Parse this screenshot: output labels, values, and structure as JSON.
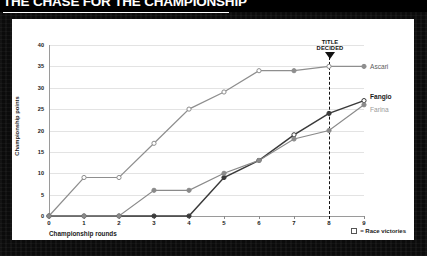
{
  "headline": "THE CHASE FOR THE CHAMPIONSHIP",
  "annotation": {
    "title_decided_line1": "TITLE",
    "title_decided_line2": "DECIDED",
    "at_round": 8
  },
  "legend": {
    "marker_icon": "open-square-icon",
    "text": "= Race victories"
  },
  "series_labels": {
    "ascari": "Ascari",
    "fangio": "Fangio",
    "farina": "Farina"
  },
  "colors": {
    "ascari": "#8e8e8e",
    "fangio": "#3a3a3a",
    "farina": "#8a8a8a",
    "grid": "#e3e3e3",
    "axis": "#9a9a9a",
    "frame": "#0b0b0b",
    "card": "#ffffff"
  },
  "chart_data": {
    "type": "line",
    "title": "THE CHASE FOR THE CHAMPIONSHIP",
    "xlabel": "Championship rounds",
    "ylabel": "Championship points",
    "x": [
      0,
      1,
      2,
      3,
      4,
      5,
      6,
      7,
      8,
      9
    ],
    "xlim": [
      0,
      9
    ],
    "ylim": [
      0,
      40
    ],
    "yticks": [
      0,
      5,
      10,
      15,
      20,
      25,
      30,
      35,
      40
    ],
    "xticks": [
      0,
      1,
      2,
      3,
      4,
      5,
      6,
      7,
      8,
      9
    ],
    "grid": true,
    "legend_position": "right-inline",
    "series": [
      {
        "name": "Ascari",
        "values": [
          0,
          9,
          9,
          17,
          25,
          29,
          34,
          34,
          35,
          35
        ],
        "victories_at": [
          1,
          2,
          3,
          4,
          5,
          6,
          8
        ],
        "color": "#8e8e8e"
      },
      {
        "name": "Fangio",
        "values": [
          0,
          0,
          0,
          0,
          0,
          9,
          13,
          19,
          24,
          27
        ],
        "victories_at": [
          7,
          9
        ],
        "color": "#3a3a3a"
      },
      {
        "name": "Farina",
        "values": [
          0,
          0,
          0,
          6,
          6,
          10,
          13,
          18,
          20,
          26
        ],
        "victories_at": [],
        "color": "#8a8a8a"
      }
    ],
    "annotations": [
      {
        "text": "TITLE DECIDED",
        "x": 8,
        "style": "dashed-vline-with-down-triangle"
      }
    ]
  }
}
